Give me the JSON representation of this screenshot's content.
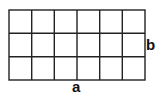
{
  "diagram": {
    "type": "rectangle-grid",
    "columns": 6,
    "rows": 3,
    "labels": {
      "bottom": "a",
      "right": "b"
    },
    "stroke_color": "#222222",
    "fill_color": "#ffffff"
  }
}
